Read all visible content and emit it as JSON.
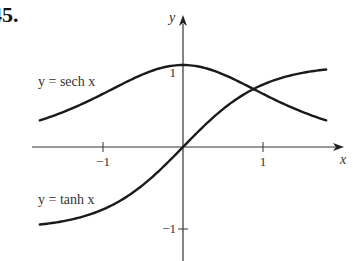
{
  "problem_number": "45.",
  "chart_data": {
    "type": "line",
    "title": "",
    "xlabel": "x",
    "ylabel": "y",
    "xlim": [
      -1.9,
      2.0
    ],
    "ylim": [
      -1.38,
      1.6
    ],
    "grid": false,
    "x_ticks": [
      {
        "value": -1,
        "label": "−1"
      },
      {
        "value": 1,
        "label": "1"
      }
    ],
    "y_ticks": [
      {
        "value": 1,
        "label": "1"
      },
      {
        "value": -1,
        "label": "−1"
      }
    ],
    "series": [
      {
        "name": "sech",
        "label": "y = sech x",
        "function": "sech",
        "x_range": [
          -1.79,
          1.79
        ],
        "color": "#1a1a1a"
      },
      {
        "name": "tanh",
        "label": "y = tanh x",
        "function": "tanh",
        "x_range": [
          -1.79,
          1.79
        ],
        "color": "#1a1a1a"
      }
    ]
  }
}
